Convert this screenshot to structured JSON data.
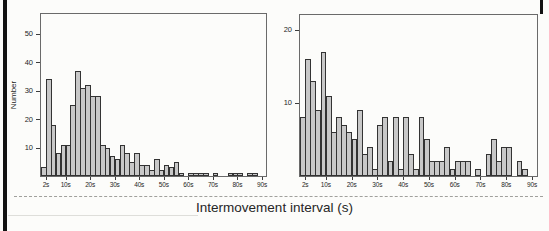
{
  "title": "Intermovement interval (s)",
  "colors": {
    "background": "#fcfcfa",
    "bar_fill": "#c8c8c8",
    "bar_border": "#333333",
    "frame": "#6a6a6a",
    "tick": "#3d3d3d",
    "text": "#1f1f1f",
    "scan_artifact": "#121212",
    "separator": "#a0a09c"
  },
  "chart_data": [
    {
      "type": "bar",
      "subtype": "histogram",
      "title": "",
      "xlabel": "",
      "ylabel": "Number",
      "bin_width_s": 2,
      "x_start": 0,
      "xlim": [
        0,
        90
      ],
      "ylim": [
        0,
        57
      ],
      "yticks": [
        10,
        20,
        30,
        40,
        50
      ],
      "xtick_values": [
        2,
        10,
        20,
        30,
        40,
        50,
        60,
        70,
        80,
        90
      ],
      "xtick_labels": [
        "2s",
        "10s",
        "20s",
        "30s",
        "40s",
        "50s",
        "60s",
        "70s",
        "80s",
        "90s"
      ],
      "values": [
        3,
        34,
        18,
        8,
        11,
        11,
        25,
        37,
        31,
        32,
        28,
        28,
        11,
        10,
        7,
        6,
        11,
        8,
        5,
        8,
        4,
        4,
        2,
        6,
        2,
        4,
        3,
        5,
        1,
        0,
        1,
        1,
        1,
        1,
        0,
        1,
        0,
        0,
        1,
        1,
        1,
        0,
        1,
        1,
        0
      ],
      "grid": false,
      "legend": "none"
    },
    {
      "type": "bar",
      "subtype": "histogram",
      "title": "",
      "xlabel": "",
      "ylabel": "",
      "bin_width_s": 2,
      "x_start": 0,
      "xlim": [
        0,
        90
      ],
      "ylim": [
        0,
        22
      ],
      "yticks": [
        10,
        20
      ],
      "xtick_values": [
        2,
        10,
        20,
        30,
        40,
        50,
        60,
        70,
        80,
        90
      ],
      "xtick_labels": [
        "2s",
        "10s",
        "20s",
        "30s",
        "40s",
        "50s",
        "60s",
        "70s",
        "80s",
        "90s"
      ],
      "values": [
        8,
        16,
        13,
        9,
        17,
        11,
        6,
        8,
        7,
        6,
        5,
        9,
        3,
        4,
        1,
        7,
        8,
        2,
        8,
        1,
        8,
        3,
        1,
        8,
        5,
        2,
        2,
        2,
        4,
        1,
        2,
        2,
        2,
        0,
        1,
        0,
        3,
        5,
        2,
        4,
        4,
        0,
        2,
        1,
        0
      ],
      "grid": false,
      "legend": "none"
    }
  ]
}
